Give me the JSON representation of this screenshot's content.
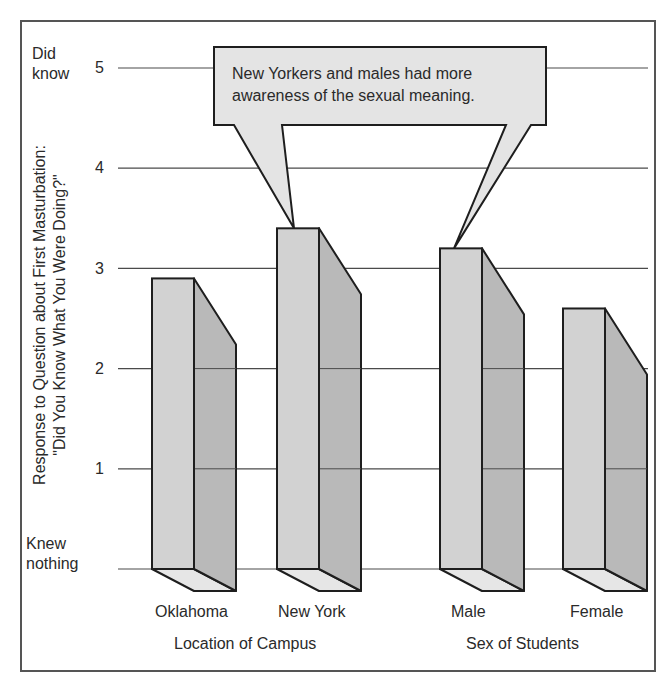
{
  "chart_data": {
    "type": "bar",
    "style": "3d-bar",
    "title": "",
    "ylabel": "Response to Question about First Masturbation: \"Did You Know What You Were Doing?\"",
    "ylabel_line1": "Response to Question about First Masturbation:",
    "ylabel_line2": "\"Did You Know What You Were Doing?\"",
    "ylim": [
      0,
      5
    ],
    "yticks": [
      0,
      1,
      2,
      3,
      4,
      5
    ],
    "ytick_labels": [
      "Knew nothing",
      "1",
      "2",
      "3",
      "4",
      "Did know 5"
    ],
    "grid": true,
    "groups": [
      {
        "name": "Location of Campus",
        "categories": [
          "Oklahoma",
          "New York"
        ],
        "values": [
          2.9,
          3.4
        ]
      },
      {
        "name": "Sex of Students",
        "categories": [
          "Male",
          "Female"
        ],
        "values": [
          3.2,
          2.6
        ]
      }
    ],
    "categories": [
      "Oklahoma",
      "New York",
      "Male",
      "Female"
    ],
    "values": [
      2.9,
      3.4,
      3.2,
      2.6
    ],
    "annotation": "New Yorkers and males had more awareness of the sexual meaning.",
    "legend": null
  },
  "axis": {
    "top_label_1": "Did",
    "top_label_2": "know",
    "bottom_label_1": "Knew",
    "bottom_label_2": "nothing",
    "ticks": [
      "1",
      "2",
      "3",
      "4",
      "5"
    ]
  },
  "callout": {
    "line1": "New Yorkers and males had more",
    "line2": "awareness of the sexual meaning."
  },
  "xlabels": {
    "bars": [
      "Oklahoma",
      "New York",
      "Male",
      "Female"
    ],
    "group1": "Location of Campus",
    "group2": "Sex of Students"
  },
  "colors": {
    "front": "#d2d2d2",
    "side": "#b9b9b9",
    "bottom": "#e6e6e6",
    "callout": "#e4e4e4",
    "outline": "#1e1e1e",
    "grid": "#4a4a4a"
  }
}
